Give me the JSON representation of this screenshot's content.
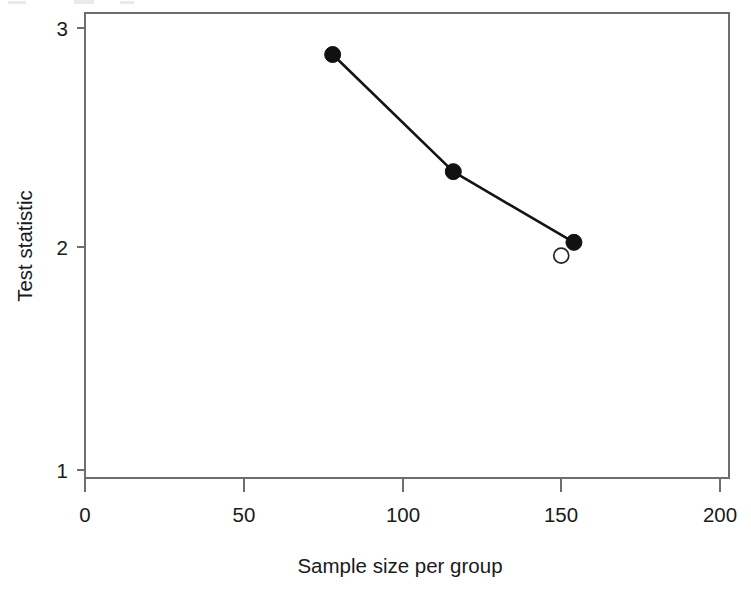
{
  "chart_data": {
    "type": "line",
    "title": "",
    "xlabel": "Sample size per group",
    "ylabel": "Test statistic",
    "xlim": [
      0,
      200
    ],
    "ylim": [
      1,
      3
    ],
    "xticks": [
      0,
      50,
      100,
      150,
      200
    ],
    "xtick_labels": [
      "0",
      "50",
      "100",
      "150",
      "200"
    ],
    "yticks": [
      1,
      2,
      3
    ],
    "ytick_labels": [
      "1",
      "2",
      "3"
    ],
    "grid": false,
    "legend": null,
    "series": [
      {
        "name": "Test statistic (filled points, connected)",
        "marker": "filled-circle",
        "connected": true,
        "x": [
          78,
          116,
          154
        ],
        "y": [
          2.88,
          2.35,
          2.03
        ]
      },
      {
        "name": "Reference point (open circle)",
        "marker": "open-circle",
        "connected": false,
        "x": [
          150
        ],
        "y": [
          1.97
        ]
      }
    ]
  },
  "axes": {
    "x_title": "Sample size per group",
    "y_title": "Test statistic",
    "x_tick_labels": [
      "0",
      "50",
      "100",
      "150",
      "200"
    ],
    "y_tick_labels": [
      "3",
      "2",
      "1"
    ]
  },
  "colors": {
    "line": "#141414",
    "point_fill": "#111111",
    "point_open_stroke": "#262626",
    "axis": "#6e6e6e",
    "background": "#ffffff",
    "text": "#1a1a1a"
  }
}
